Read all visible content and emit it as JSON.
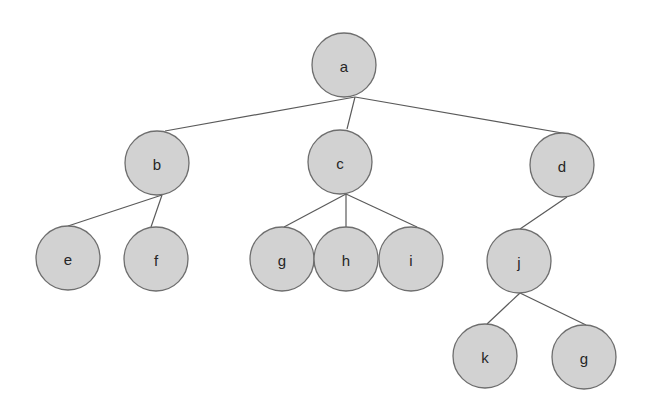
{
  "diagram": {
    "type": "tree",
    "colors": {
      "node_fill": "#d2d2d2",
      "node_stroke": "#6e6e6e",
      "edge": "#5a5a5a",
      "label": "#262626",
      "background": "#ffffff"
    },
    "node_radius": 32,
    "nodes": [
      {
        "id": "a",
        "label": "a",
        "x": 344,
        "y": 65
      },
      {
        "id": "b",
        "label": "b",
        "x": 157,
        "y": 163
      },
      {
        "id": "c",
        "label": "c",
        "x": 340,
        "y": 162
      },
      {
        "id": "d",
        "label": "d",
        "x": 562,
        "y": 165
      },
      {
        "id": "e",
        "label": "e",
        "x": 68,
        "y": 258
      },
      {
        "id": "f",
        "label": "f",
        "x": 156,
        "y": 259
      },
      {
        "id": "g",
        "label": "g",
        "x": 282,
        "y": 259
      },
      {
        "id": "h",
        "label": "h",
        "x": 346,
        "y": 259
      },
      {
        "id": "i",
        "label": "i",
        "x": 411,
        "y": 259
      },
      {
        "id": "j",
        "label": "j",
        "x": 519,
        "y": 261
      },
      {
        "id": "k",
        "label": "k",
        "x": 485,
        "y": 356
      },
      {
        "id": "g2",
        "label": "g",
        "x": 584,
        "y": 357
      }
    ],
    "edges": [
      {
        "from": "a",
        "to": "b",
        "x1": 355,
        "y1": 97,
        "x2": 165,
        "y2": 131
      },
      {
        "from": "a",
        "to": "c",
        "x1": 355,
        "y1": 97,
        "x2": 347,
        "y2": 129
      },
      {
        "from": "a",
        "to": "d",
        "x1": 355,
        "y1": 97,
        "x2": 568,
        "y2": 134
      },
      {
        "from": "b",
        "to": "e",
        "x1": 162,
        "y1": 195,
        "x2": 68,
        "y2": 226
      },
      {
        "from": "b",
        "to": "f",
        "x1": 162,
        "y1": 195,
        "x2": 151,
        "y2": 227
      },
      {
        "from": "c",
        "to": "g",
        "x1": 346,
        "y1": 194,
        "x2": 284,
        "y2": 227
      },
      {
        "from": "c",
        "to": "h",
        "x1": 346,
        "y1": 194,
        "x2": 346,
        "y2": 227
      },
      {
        "from": "c",
        "to": "i",
        "x1": 346,
        "y1": 194,
        "x2": 417,
        "y2": 227
      },
      {
        "from": "d",
        "to": "j",
        "x1": 567,
        "y1": 197,
        "x2": 520,
        "y2": 229
      },
      {
        "from": "j",
        "to": "k",
        "x1": 520,
        "y1": 293,
        "x2": 487,
        "y2": 324
      },
      {
        "from": "j",
        "to": "g2",
        "x1": 520,
        "y1": 293,
        "x2": 586,
        "y2": 325
      }
    ]
  }
}
